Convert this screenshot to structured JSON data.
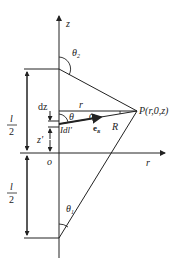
{
  "diagram": {
    "axes": {
      "z_label": "z",
      "r_label": "r",
      "origin_label": "o"
    },
    "angles": {
      "theta2": "θ",
      "theta2_sub": "2",
      "theta1": "θ",
      "theta1_sub": "1",
      "theta": "θ",
      "alpha": "α"
    },
    "point": {
      "label": "P(r,0,z)"
    },
    "segments": {
      "r": "r",
      "R": "R",
      "unit_vector": "e",
      "unit_vector_sub": "R"
    },
    "element": {
      "dz": "dz",
      "current_element": "Idl'",
      "z_prime": "z'"
    },
    "dimensions": {
      "top_half_num": "l",
      "top_half_den": "2",
      "bottom_half_num": "l",
      "bottom_half_den": "2"
    }
  }
}
